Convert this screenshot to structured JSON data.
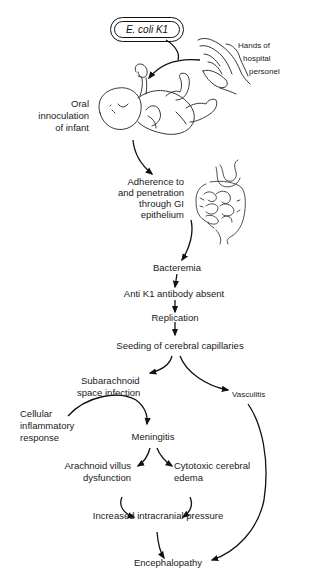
{
  "diagram": {
    "nodes": {
      "ecoli": "E. coli K1",
      "hands_1": "Hands of",
      "hands_2": "hospital",
      "hands_3": "personel",
      "oral_1": "Oral",
      "oral_2": "innoculation",
      "oral_3": "of infant",
      "adh_1": "Adherence to",
      "adh_2": "and penetration",
      "adh_3": "through GI",
      "adh_4": "epithelium",
      "bacteremia": "Bacteremia",
      "antibody": "Anti K1 antibody absent",
      "replication": "Replication",
      "seeding": "Seeding of cerebral capillaries",
      "subarach_1": "Subarachnoid",
      "subarach_2": "space infection",
      "vasculitis": "Vasculitis",
      "cellular_1": "Cellular",
      "cellular_2": "inflammatory",
      "cellular_3": "response",
      "meningitis": "Meningitis",
      "arach_1": "Arachnoid villus",
      "arach_2": "dysfunction",
      "cyto_1": "Cytotoxic cerebral",
      "cyto_2": "edema",
      "icp": "Increased intracranial pressure",
      "enceph": "Encephalopathy"
    },
    "edges": [
      [
        "E. coli K1",
        "Oral innoculation of infant"
      ],
      [
        "Hands of hospital personel",
        "Oral innoculation of infant"
      ],
      [
        "Oral innoculation of infant",
        "Adherence to and penetration through GI epithelium"
      ],
      [
        "Adherence to and penetration through GI epithelium",
        "Bacteremia"
      ],
      [
        "Bacteremia",
        "Anti K1 antibody absent"
      ],
      [
        "Anti K1 antibody absent",
        "Replication"
      ],
      [
        "Replication",
        "Seeding of cerebral capillaries"
      ],
      [
        "Seeding of cerebral capillaries",
        "Subarachnoid space infection"
      ],
      [
        "Seeding of cerebral capillaries",
        "Vasculitis"
      ],
      [
        "Cellular inflammatory response",
        "Meningitis"
      ],
      [
        "Subarachnoid space infection",
        "Meningitis"
      ],
      [
        "Meningitis",
        "Arachnoid villus dysfunction"
      ],
      [
        "Meningitis",
        "Cytotoxic cerebral edema"
      ],
      [
        "Arachnoid villus dysfunction",
        "Increased intracranial pressure"
      ],
      [
        "Cytotoxic cerebral edema",
        "Increased intracranial pressure"
      ],
      [
        "Increased intracranial pressure",
        "Encephalopathy"
      ],
      [
        "Vasculitis",
        "Encephalopathy"
      ]
    ],
    "illustrations": [
      "infant-illustration",
      "hands-illustration",
      "intestine-illustration"
    ]
  }
}
